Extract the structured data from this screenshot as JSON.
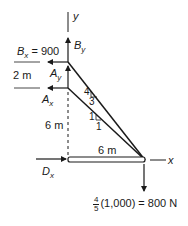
{
  "diagram": {
    "type": "free-body diagram",
    "axes": {
      "x_label": "x",
      "y_label": "y"
    },
    "forces": {
      "Bx": {
        "symbol": "B",
        "subscript": "x",
        "value_text": "= 900"
      },
      "By": {
        "symbol": "B",
        "subscript": "y"
      },
      "Ay": {
        "symbol": "A",
        "subscript": "y"
      },
      "Ax": {
        "symbol": "A",
        "subscript": "x"
      },
      "Dx": {
        "symbol": "D",
        "subscript": "x"
      },
      "load": {
        "frac_num": "4",
        "frac_den": "5",
        "text": "(1,000) = 800 N"
      }
    },
    "dimensions": {
      "ab_spacing": "2 m",
      "vertical": "6 m",
      "horizontal": "6 m"
    },
    "slopes": {
      "upper_member": {
        "rise": "4",
        "run": "3"
      },
      "lower_member": {
        "rise": "1",
        "run": "1"
      }
    },
    "colors": {
      "line": "#1a1a1a",
      "background": "#ffffff"
    }
  }
}
